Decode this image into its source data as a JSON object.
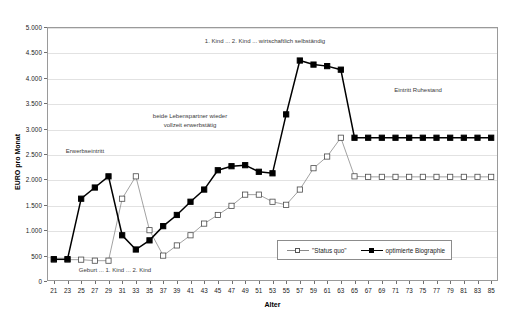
{
  "chart_data": {
    "type": "line",
    "title": "",
    "xlabel": "Alter",
    "ylabel": "EURO pro Monat",
    "xlim": [
      20,
      86
    ],
    "ylim": [
      0,
      5000
    ],
    "ytick_step": 500,
    "grid": true,
    "legend_position": "bottom-right",
    "ytick_labels": [
      "0",
      "500",
      "1.000",
      "1.500",
      "2.000",
      "2.500",
      "3.000",
      "3.500",
      "4.000",
      "4.500",
      "5.000"
    ],
    "ytick_values": [
      0,
      500,
      1000,
      1500,
      2000,
      2500,
      3000,
      3500,
      4000,
      4500,
      5000
    ],
    "categories": [
      21,
      23,
      25,
      27,
      29,
      31,
      33,
      35,
      37,
      39,
      41,
      43,
      45,
      47,
      49,
      51,
      53,
      55,
      57,
      59,
      61,
      63,
      65,
      67,
      69,
      71,
      73,
      75,
      77,
      79,
      81,
      83,
      85
    ],
    "xtick_labels": [
      "21",
      "23",
      "25",
      "27",
      "29",
      "31",
      "33",
      "35",
      "37",
      "39",
      "41",
      "43",
      "45",
      "47",
      "49",
      "51",
      "53",
      "55",
      "57",
      "59",
      "61",
      "63",
      "65",
      "67",
      "69",
      "71",
      "73",
      "75",
      "77",
      "79",
      "81",
      "83",
      "85"
    ],
    "series": [
      {
        "name": "\"Status quo\"",
        "marker": "open-square",
        "color": "#8a8a8a",
        "values": [
          420,
          420,
          420,
          400,
          400,
          1620,
          2060,
          1000,
          500,
          700,
          900,
          1130,
          1300,
          1480,
          1700,
          1700,
          1560,
          1500,
          1800,
          2220,
          2450,
          2820,
          2060,
          2050,
          2050,
          2050,
          2050,
          2050,
          2050,
          2050,
          2050,
          2050,
          2050
        ]
      },
      {
        "name": "optimierte Biographie",
        "marker": "filled-square",
        "color": "#000000",
        "values": [
          430,
          430,
          1620,
          1840,
          2060,
          900,
          620,
          800,
          1080,
          1300,
          1560,
          1800,
          2180,
          2260,
          2280,
          2150,
          2120,
          3280,
          4340,
          4260,
          4230,
          4160,
          2820,
          2820,
          2820,
          2820,
          2820,
          2820,
          2820,
          2820,
          2820,
          2820,
          2820
        ]
      }
    ],
    "annotations": [
      {
        "text": "1. Kind ... 2. Kind ...  wirtschaftlich selbständig",
        "x": 265,
        "y": 37
      },
      {
        "text": "beide Lebenspartner wieder",
        "x": 190,
        "y": 112
      },
      {
        "text": "vollzeit erwerbstätig",
        "x": 190,
        "y": 121
      },
      {
        "text": "Erwerbseintritt",
        "x": 85,
        "y": 147
      },
      {
        "text": "Geburt ... 1. Kind ... 2. Kind",
        "x": 115,
        "y": 266
      },
      {
        "text": "Eintritt Ruhestand",
        "x": 418,
        "y": 86
      }
    ]
  }
}
